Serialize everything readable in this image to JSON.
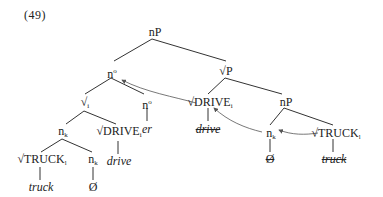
{
  "example_number": "(49)",
  "nodes": {
    "root": {
      "label": "nP"
    },
    "n_head": {
      "label": "n",
      "sup": "o"
    },
    "sqrtP": {
      "label": "√P"
    },
    "sqrt_i": {
      "label": "√",
      "sub": "i"
    },
    "n_er": {
      "label": "n",
      "sup": "o"
    },
    "er": {
      "label": "er"
    },
    "nk_left": {
      "label": "n",
      "sub": "k"
    },
    "drive_left": {
      "label": "√DRIVE",
      "sub": "i"
    },
    "drive_left_word": {
      "label": "drive"
    },
    "truck_left": {
      "label": "√TRUCK",
      "sub": "l"
    },
    "truck_left_word": {
      "label": "truck"
    },
    "nk_left2": {
      "label": "n",
      "sub": "k"
    },
    "null_left": {
      "label": "Ø"
    },
    "drive_right": {
      "label": "√DRIVE",
      "sub": "i"
    },
    "drive_right_word": {
      "label": "drive"
    },
    "nP_right": {
      "label": "nP"
    },
    "nk_right": {
      "label": "n",
      "sub": "k"
    },
    "null_right": {
      "label": "Ø"
    },
    "truck_right": {
      "label": "√TRUCK",
      "sub": "l"
    },
    "truck_right_word": {
      "label": "truck"
    }
  },
  "colors": {
    "line": "#333333",
    "arrow": "#555555",
    "text": "#222222"
  }
}
